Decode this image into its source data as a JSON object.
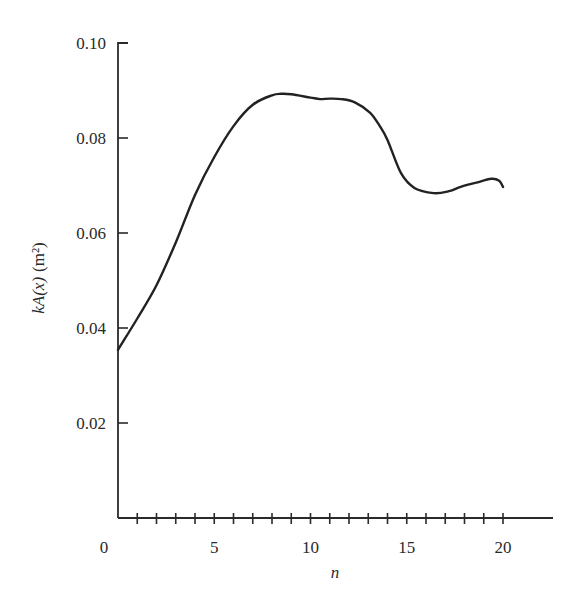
{
  "chart_data": {
    "type": "line",
    "title": "",
    "xlabel": "n",
    "ylabel": "kA(x) (m²)",
    "ylabel_parts": {
      "italic": "kA(x)",
      "unit": "(m²)"
    },
    "xlim": [
      0,
      23
    ],
    "ylim": [
      0,
      0.1
    ],
    "x_ticks_major": [
      0,
      5,
      10,
      15,
      20
    ],
    "x_tick_labels": [
      "0",
      "5",
      "10",
      "15",
      "20"
    ],
    "x_ticks_minor_step": 1,
    "y_ticks": [
      0.02,
      0.04,
      0.06,
      0.08,
      0.1
    ],
    "y_tick_labels": [
      "0.02",
      "0.04",
      "0.06",
      "0.08",
      "0.10"
    ],
    "grid": false,
    "legend": null,
    "series": [
      {
        "name": "kA(x)",
        "color": "#222222",
        "x": [
          0,
          1,
          2,
          3,
          4,
          5,
          6,
          7,
          8,
          8.5,
          9,
          10,
          10.5,
          11,
          11.6,
          12.3,
          13.1,
          13.6,
          14.0,
          14.7,
          15.4,
          16.4,
          17.2,
          17.8,
          18.6,
          19.4,
          19.8,
          20
        ],
        "values": [
          0.0354,
          0.042,
          0.049,
          0.058,
          0.068,
          0.076,
          0.0825,
          0.087,
          0.089,
          0.0893,
          0.0892,
          0.0885,
          0.0882,
          0.0883,
          0.0882,
          0.0875,
          0.0853,
          0.0825,
          0.0796,
          0.0726,
          0.0695,
          0.0684,
          0.0688,
          0.0697,
          0.0706,
          0.0714,
          0.071,
          0.0697
        ]
      }
    ]
  },
  "layout": {
    "plot_left_px": 118,
    "plot_right_px": 553,
    "x_axis_y_px": 518,
    "y_top_px": 43,
    "px_per_x_unit": 19.25,
    "px_per_y_unit": 4750
  }
}
